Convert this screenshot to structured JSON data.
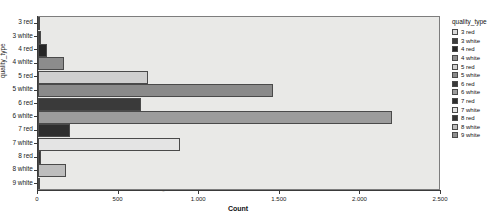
{
  "background_text": [
    {
      "text": "dia, is 0 red and corresponding the values and the rest.",
      "x": 95,
      "y": 22,
      "size": 13
    },
    {
      "text": "test all times data, in rich 46 totaling 4",
      "x": 85,
      "y": 52,
      "size": 14
    },
    {
      "text": "for induced the pump of pottage",
      "x": 85,
      "y": 70,
      "size": 14
    },
    {
      "text": "while compares are made to produce the",
      "x": 82,
      "y": 88,
      "size": 13
    },
    {
      "text": "High quality means the same. The regional",
      "x": 80,
      "y": 112,
      "size": 14
    },
    {
      "text": "9 White means the most red, 10 the other",
      "x": 80,
      "y": 128,
      "size": 13
    },
    {
      "text": "and Low is sure to drop, 1 = 1%.",
      "x": 80,
      "y": 146,
      "size": 14
    },
    {
      "text": "contained for wine quality distribution. Regions",
      "x": 78,
      "y": 162,
      "size": 12
    },
    {
      "text": "is a 255 index respects them the number for Dim",
      "x": 78,
      "y": 178,
      "size": 12
    }
  ],
  "chart_data": {
    "type": "bar",
    "orientation": "horizontal",
    "title": "",
    "xlabel": "Count",
    "ylabel": "quality_type",
    "categories": [
      "3 red",
      "3 white",
      "4 red",
      "4 white",
      "5 red",
      "5 white",
      "6 red",
      "6 white",
      "7 red",
      "7 white",
      "8 red",
      "8 white",
      "9 white"
    ],
    "values": [
      10,
      20,
      53,
      163,
      681,
      1457,
      638,
      2198,
      199,
      880,
      18,
      175,
      5
    ],
    "xlim": [
      0,
      2500
    ],
    "ylim_categories": 13,
    "xticks": [
      0,
      500,
      1000,
      1500,
      2000,
      2500
    ],
    "xtick_labels": [
      "0",
      "500",
      "1.000",
      "1.500",
      "2.000",
      "2.500"
    ],
    "grid": false,
    "legend_position": "right",
    "legend_title": "quality_type",
    "series": [
      {
        "name": "3 red",
        "value": 10,
        "color": "#d9d9d9"
      },
      {
        "name": "3 white",
        "value": 20,
        "color": "#3d3d3d"
      },
      {
        "name": "4 red",
        "value": 53,
        "color": "#262626"
      },
      {
        "name": "4 white",
        "value": 163,
        "color": "#8c8c8c"
      },
      {
        "name": "5 red",
        "value": 681,
        "color": "#cfcfcf"
      },
      {
        "name": "5 white",
        "value": 1457,
        "color": "#8a8a8a"
      },
      {
        "name": "6 red",
        "value": 638,
        "color": "#3a3a3a"
      },
      {
        "name": "6 white",
        "value": 2198,
        "color": "#9c9c9c"
      },
      {
        "name": "7 red",
        "value": 199,
        "color": "#2e2e2e"
      },
      {
        "name": "7 white",
        "value": 880,
        "color": "#e4e4e4"
      },
      {
        "name": "8 red",
        "value": 18,
        "color": "#333333"
      },
      {
        "name": "8 white",
        "value": 175,
        "color": "#bdbdbd"
      },
      {
        "name": "9 white",
        "value": 5,
        "color": "#8f8f8f"
      }
    ]
  }
}
